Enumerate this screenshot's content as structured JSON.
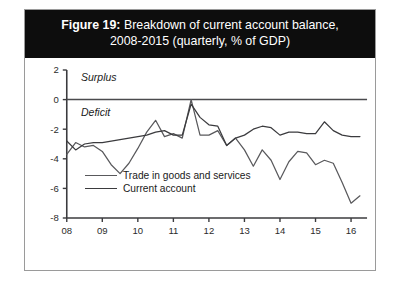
{
  "figure": {
    "number_label": "Figure 19:",
    "title_line1": " Breakdown of current account balance,",
    "title_line2": "2008-2015 (quarterly, % of GDP)"
  },
  "annotations": {
    "surplus": "Surplus",
    "deficit": "Deficit"
  },
  "legend": {
    "trade": "Trade in goods and services",
    "current_account": "Current account"
  },
  "colors": {
    "title_bar_bg": "#0d0d0d",
    "title_bar_text": "#ffffff",
    "frame_border": "#9a9a9a",
    "axis": "#3b3b3e",
    "zero_line": "#4a4a4d",
    "series_trade": "#59595c",
    "series_current_account": "#3b3b3e"
  },
  "chart_data": {
    "type": "line",
    "title": "Figure 19: Breakdown of current account balance, 2008-2015 (quarterly, % of GDP)",
    "xlabel": "",
    "ylabel": "",
    "ylim": [
      -8,
      2
    ],
    "yticks": [
      2,
      0,
      -2,
      -4,
      -6,
      -8
    ],
    "ytick_labels": [
      "2",
      "0",
      "-2",
      "-4",
      "-6",
      "-8"
    ],
    "xticks": [
      2008,
      2009,
      2010,
      2011,
      2012,
      2013,
      2014,
      2015,
      2016
    ],
    "xtick_labels": [
      "08",
      "09",
      "10",
      "11",
      "12",
      "13",
      "14",
      "15",
      "16"
    ],
    "xlim": [
      2008,
      2016.45
    ],
    "grid": false,
    "legend_position": "inside-lower-left",
    "zero_reference_line": 0,
    "x": [
      2008.0,
      2008.25,
      2008.5,
      2008.75,
      2009.0,
      2009.25,
      2009.5,
      2009.75,
      2010.0,
      2010.25,
      2010.5,
      2010.75,
      2011.0,
      2011.25,
      2011.5,
      2011.75,
      2012.0,
      2012.25,
      2012.5,
      2012.75,
      2013.0,
      2013.25,
      2013.5,
      2013.75,
      2014.0,
      2014.25,
      2014.5,
      2014.75,
      2015.0,
      2015.25,
      2015.5,
      2015.75,
      2016.0,
      2016.25
    ],
    "series": [
      {
        "name": "Trade in goods and services",
        "values": [
          -3.7,
          -2.9,
          -3.2,
          -3.1,
          -3.5,
          -4.4,
          -5.0,
          -4.3,
          -3.3,
          -2.2,
          -1.4,
          -2.5,
          -2.3,
          -2.6,
          0.0,
          -2.4,
          -2.4,
          -2.1,
          -3.1,
          -2.6,
          -3.4,
          -4.5,
          -3.4,
          -4.1,
          -5.4,
          -4.2,
          -3.5,
          -3.6,
          -4.4,
          -4.1,
          -4.3,
          -5.6,
          -7.0,
          -6.5
        ]
      },
      {
        "name": "Current account",
        "values": [
          -2.8,
          -3.4,
          -3.0,
          -2.9,
          -2.9,
          -2.8,
          -2.7,
          -2.6,
          -2.5,
          -2.4,
          -2.2,
          -2.1,
          -2.4,
          -2.4,
          -0.3,
          -1.2,
          -1.7,
          -1.8,
          -3.1,
          -2.6,
          -2.4,
          -2.0,
          -1.8,
          -1.9,
          -2.4,
          -2.2,
          -2.2,
          -2.3,
          -2.3,
          -1.5,
          -2.1,
          -2.4,
          -2.5,
          -2.5
        ]
      }
    ]
  }
}
